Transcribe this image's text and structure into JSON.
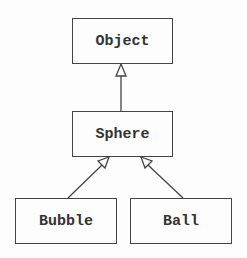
{
  "diagram": {
    "type": "uml-class-hierarchy",
    "nodes": [
      {
        "id": "object",
        "label": "Object"
      },
      {
        "id": "sphere",
        "label": "Sphere"
      },
      {
        "id": "bubble",
        "label": "Bubble"
      },
      {
        "id": "ball",
        "label": "Ball"
      }
    ],
    "edges": [
      {
        "from": "sphere",
        "to": "object",
        "kind": "inheritance"
      },
      {
        "from": "bubble",
        "to": "sphere",
        "kind": "inheritance"
      },
      {
        "from": "ball",
        "to": "sphere",
        "kind": "inheritance"
      }
    ]
  }
}
